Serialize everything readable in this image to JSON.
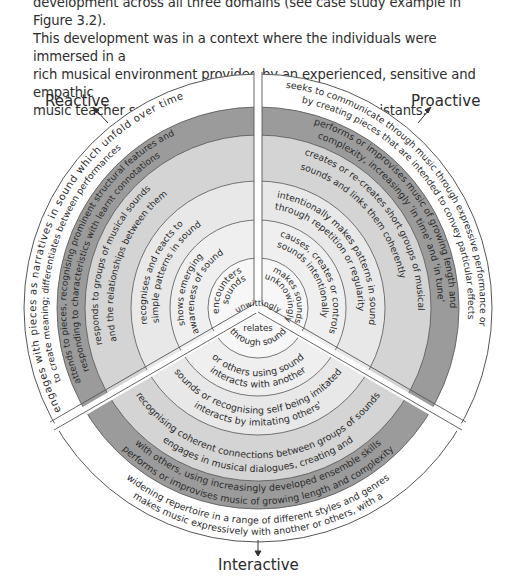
{
  "intro_text": [
    "development across all three domains (see case study example in Figure 3.2).",
    "This development was in a context where the individuals were immersed in a",
    "rich musical environment provided by an experienced, sensitive and empathic",
    "music teacher supported by a group of classroom assistants."
  ],
  "domains": {
    "reactive": "Reactive",
    "proactive": "Proactive",
    "interactive": "Interactive"
  },
  "colors": {
    "ring_dark": "#9a9a9a",
    "ring_mid": "#cfcfcf",
    "ring_light": "#e6e6e6",
    "ring_lighter": "#efefef",
    "ring_white": "#ffffff",
    "line": "#555555"
  },
  "reactive_levels": [
    "encounters sounds",
    "shows emerging awareness of sound",
    "recognises and reacts to simple patterns in sound",
    "responds to groups of musical sounds and the relationships between them",
    "attends to pieces, recognising prominent structural features and responding to characteristics with learnt connotations",
    "engages with pieces as narratives in sound which unfold over time to create meaning; differentiates between performances"
  ],
  "proactive_levels": [
    "makes sounds unknowingly",
    "causes, creates or controls sounds intentionally",
    "intentionally makes patterns in sound through repetition or regularity",
    "creates or re-creates short groups of musical sounds and links them coherently",
    "performs or improvises music of growing length and complexity, increasingly 'in time' and 'in tune'",
    "seeks to communicate through music through expressive performance or by creating pieces that are intended to convey particular effects"
  ],
  "interactive_levels": [
    "unwittingly relates through sound",
    "interacts with another or others using sound",
    "interacts by imitating others' sounds or recognising self being imitated",
    "engages in musical dialogues, creating and recognising coherent connections between groups of sounds",
    "performs or improvises music of growing length and complexity with others, using increasingly developed ensemble skills",
    "makes music expressively with another or others, with a widening repertoire in a range of different styles and genres"
  ],
  "arc_lines": {
    "r_enc_1": "encounters",
    "r_enc_2": "sounds",
    "r_aw_1": "shows emerging",
    "r_aw_2": "awareness of sound",
    "r_pat_1": "recognises and reacts to",
    "r_pat_2": "simple patterns in sound",
    "r_grp_1": "responds to groups of musical sounds",
    "r_grp_2": "and the relationships between them",
    "r_att_1": "attends to pieces, recognising prominent structural features and",
    "r_att_2": "responding to characteristics with learnt connotations",
    "r_eng_1": "engages with pieces as narratives in sound which unfold over time",
    "r_eng_2": "to create meaning; differentiates between performances",
    "p_mk_1": "makes sounds",
    "p_mk_2": "unknowingly",
    "p_cau_1": "causes, creates or controls",
    "p_cau_2": "sounds intentionally",
    "p_int_1": "intentionally makes patterns in sound",
    "p_int_2": "through repetition or regularity",
    "p_cre_1": "creates or re-creates short groups of musical",
    "p_cre_2": "sounds and links them coherently",
    "p_per_1": "performs or improvises music of growing length and",
    "p_per_2": "complexity, increasingly 'in time' and 'in tune'",
    "p_see_1": "seeks to communicate through music through expressive performance or",
    "p_see_2": "by creating pieces that are intended to convey particular effects",
    "i_unw_1": "unwittingly",
    "i_unw_2": "relates",
    "i_unw_3": "through sound",
    "i_ia_1": "interacts with another",
    "i_ia_2": "or others using sound",
    "i_im_1": "interacts by imitating others'",
    "i_im_2": "sounds or recognising self being imitated",
    "i_eng_1": "engages in musical dialogues, creating and",
    "i_eng_2": "recognising coherent connections between groups of sounds",
    "i_per_1": "performs or improvises music of growing length and complexity",
    "i_per_2": "with others, using increasingly developed ensemble skills",
    "i_mm_1": "makes music expressively with another or others, with a",
    "i_mm_2": "widening repertoire in a range of different styles and genres"
  },
  "caption_partial": "Figure 3.2  A case study example of musical development across the three domains"
}
